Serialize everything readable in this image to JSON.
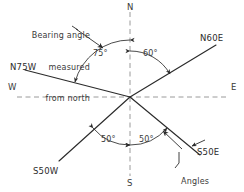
{
  "diagram": {
    "colors": {
      "line": "#2b2b2b",
      "axis": "#8a8a8a",
      "text": "#2b2b2b",
      "background": "#ffffff"
    },
    "origin": {
      "x": 130,
      "y": 97
    },
    "cardinals": [
      {
        "key": "north",
        "label": "N",
        "x": 127,
        "y": 2
      },
      {
        "key": "south",
        "label": "S",
        "x": 127,
        "y": 178
      },
      {
        "key": "east",
        "label": "E",
        "x": 231,
        "y": 82
      },
      {
        "key": "west",
        "label": "W",
        "x": 8,
        "y": 82
      }
    ],
    "bearings": [
      {
        "key": "n60e",
        "label": "N60E",
        "x": 200,
        "y": 33,
        "angle_from_north_deg": 60,
        "quadrant": "NE"
      },
      {
        "key": "n75w",
        "label": "N75W",
        "x": 10,
        "y": 62,
        "angle_from_north_deg": 75,
        "quadrant": "NW"
      },
      {
        "key": "s50e",
        "label": "S50E",
        "x": 197,
        "y": 147,
        "angle_from_south_deg": 50,
        "quadrant": "SE"
      },
      {
        "key": "s50w",
        "label": "S50W",
        "x": 33,
        "y": 166,
        "angle_from_south_deg": 50,
        "quadrant": "SW"
      }
    ],
    "angle_labels": [
      {
        "key": "angle-75",
        "label": "75°",
        "x": 93,
        "y": 49
      },
      {
        "key": "angle-60",
        "label": "60°",
        "x": 143,
        "y": 49
      },
      {
        "key": "angle-50-west",
        "label": "50°",
        "x": 101,
        "y": 135
      },
      {
        "key": "angle-50-east",
        "label": "50°",
        "x": 139,
        "y": 135
      }
    ],
    "annotations": [
      {
        "key": "north-note",
        "lines": [
          "Bearing angle",
          "measured",
          "from north"
        ],
        "x": 12,
        "y": 10,
        "align": "right"
      },
      {
        "key": "south-note",
        "lines": [
          "Angles",
          "measured",
          "from south"
        ],
        "x": 176,
        "y": 157,
        "align": "left"
      }
    ]
  }
}
